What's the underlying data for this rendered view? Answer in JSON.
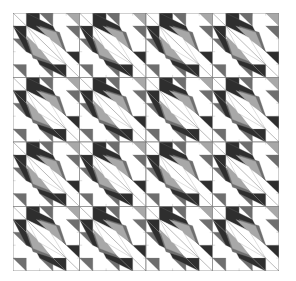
{
  "figure": {
    "type": "quilt-pattern",
    "grid": {
      "rows": 4,
      "cols": 4
    },
    "colors": {
      "background": "#ffffff",
      "dark": "#2e2e2e",
      "mid": "#6e6e6e",
      "light": "#a8a8a8",
      "white": "#ffffff",
      "line": "#7a7a7a"
    }
  }
}
